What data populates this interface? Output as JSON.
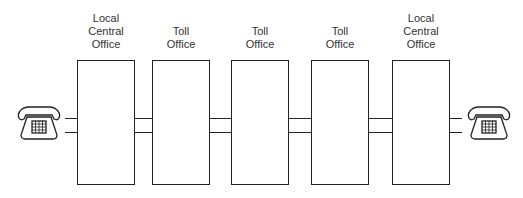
{
  "diagram": {
    "colors": {
      "stroke": "#222222",
      "text": "#333333",
      "background": "#ffffff"
    },
    "endpoints": [
      {
        "id": "left-phone",
        "icon": "telephone-icon"
      },
      {
        "id": "right-phone",
        "icon": "telephone-icon"
      }
    ],
    "offices": [
      {
        "lines": [
          "Local",
          "Central",
          "Office"
        ]
      },
      {
        "lines": [
          "Toll",
          "Office"
        ]
      },
      {
        "lines": [
          "Toll",
          "Office"
        ]
      },
      {
        "lines": [
          "Toll",
          "Office"
        ]
      },
      {
        "lines": [
          "Local",
          "Central",
          "Office"
        ]
      }
    ]
  }
}
